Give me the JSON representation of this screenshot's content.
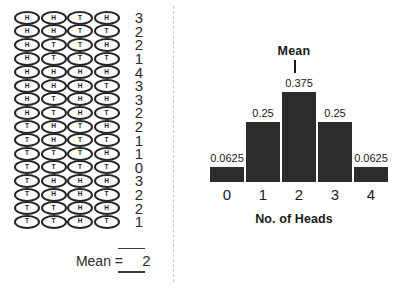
{
  "left_panel": {
    "trials": [
      {
        "flips": [
          "H",
          "H",
          "T",
          "H"
        ],
        "count": "3"
      },
      {
        "flips": [
          "H",
          "H",
          "T",
          "T"
        ],
        "count": "2"
      },
      {
        "flips": [
          "H",
          "T",
          "T",
          "H"
        ],
        "count": "2"
      },
      {
        "flips": [
          "H",
          "T",
          "T",
          "T"
        ],
        "count": "1"
      },
      {
        "flips": [
          "H",
          "H",
          "H",
          "H"
        ],
        "count": "4"
      },
      {
        "flips": [
          "H",
          "H",
          "H",
          "T"
        ],
        "count": "3"
      },
      {
        "flips": [
          "H",
          "T",
          "H",
          "H"
        ],
        "count": "3"
      },
      {
        "flips": [
          "H",
          "T",
          "H",
          "T"
        ],
        "count": "2"
      },
      {
        "flips": [
          "T",
          "H",
          "T",
          "H"
        ],
        "count": "2"
      },
      {
        "flips": [
          "T",
          "H",
          "T",
          "T"
        ],
        "count": "1"
      },
      {
        "flips": [
          "T",
          "T",
          "T",
          "H"
        ],
        "count": "1"
      },
      {
        "flips": [
          "T",
          "T",
          "T",
          "T"
        ],
        "count": "0"
      },
      {
        "flips": [
          "T",
          "H",
          "H",
          "H"
        ],
        "count": "3"
      },
      {
        "flips": [
          "T",
          "H",
          "H",
          "T"
        ],
        "count": "2"
      },
      {
        "flips": [
          "T",
          "T",
          "H",
          "H"
        ],
        "count": "2"
      },
      {
        "flips": [
          "T",
          "T",
          "H",
          "T"
        ],
        "count": "1"
      }
    ],
    "mean_label": "Mean =",
    "mean_value": "2"
  },
  "right_panel": {
    "mean_marker_label": "Mean"
  },
  "chart_data": {
    "type": "bar",
    "title": "",
    "categories": [
      "0",
      "1",
      "2",
      "3",
      "4"
    ],
    "values": [
      0.0625,
      0.25,
      0.375,
      0.25,
      0.0625
    ],
    "value_labels": [
      "0.0625",
      "0.25",
      "0.375",
      "0.25",
      "0.0625"
    ],
    "xlabel": "No. of Heads",
    "ylabel": "",
    "ylim": [
      0,
      0.4
    ],
    "grid": false,
    "legend": false,
    "annotations": [
      {
        "text": "Mean",
        "at_category": "2"
      }
    ],
    "bar_color": "#2c2c2c"
  }
}
